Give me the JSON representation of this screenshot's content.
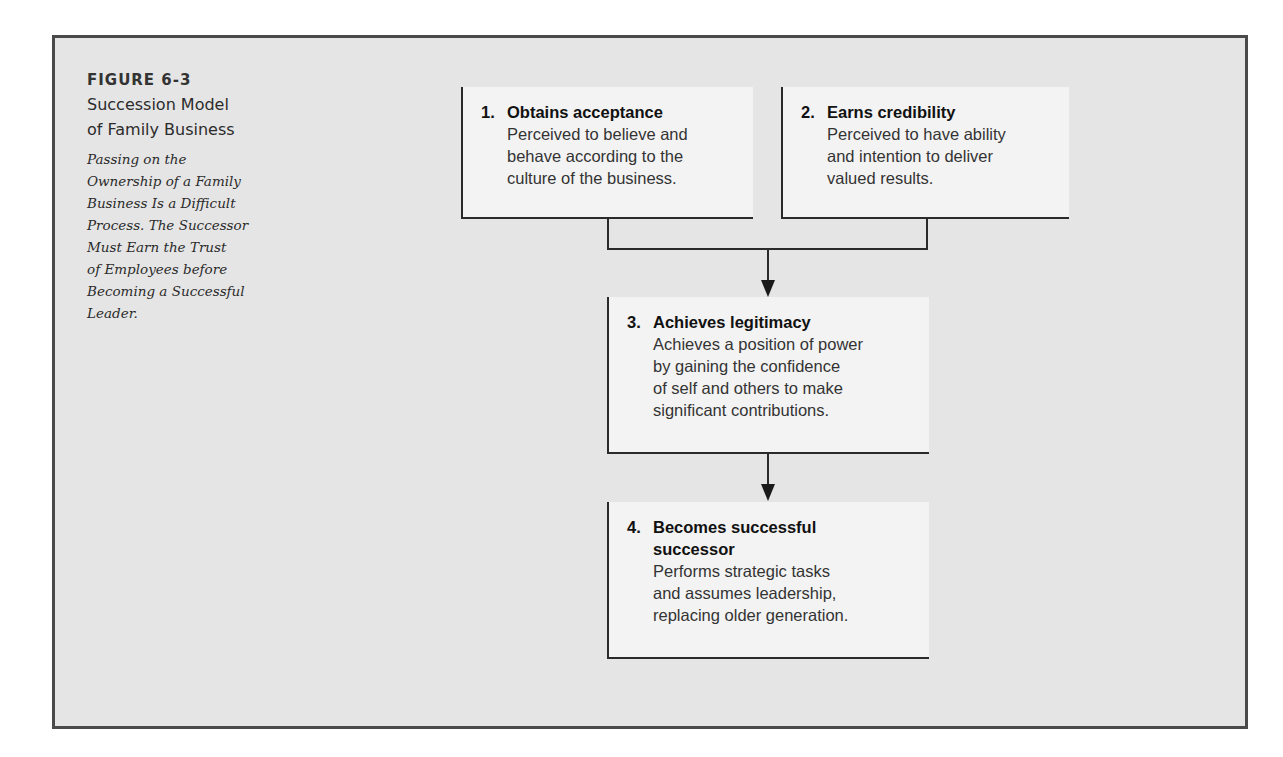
{
  "figure": {
    "label": "FIGURE 6-3",
    "title_line1": "Succession Model",
    "title_line2": "of Family Business",
    "description_lines": [
      "Passing on the",
      "Ownership of a Family",
      "Business Is a Difficult",
      "Process. The Successor",
      "Must Earn the Trust",
      "of Employees before",
      "Becoming a Successful",
      "Leader."
    ]
  },
  "steps": [
    {
      "number": "1.",
      "title_lines": [
        "Obtains acceptance"
      ],
      "body_lines": [
        "Perceived to believe and",
        "behave according to the",
        "culture of the business."
      ]
    },
    {
      "number": "2.",
      "title_lines": [
        "Earns credibility"
      ],
      "body_lines": [
        "Perceived to have ability",
        "and intention to deliver",
        "valued results."
      ]
    },
    {
      "number": "3.",
      "title_lines": [
        "Achieves legitimacy"
      ],
      "body_lines": [
        "Achieves a position of power",
        "by gaining the confidence",
        "of self and others to make",
        "significant contributions."
      ]
    },
    {
      "number": "4.",
      "title_lines": [
        "Becomes successful",
        "successor"
      ],
      "body_lines": [
        "Performs strategic tasks",
        "and assumes leadership,",
        "replacing older generation."
      ]
    }
  ],
  "colors": {
    "frame_background": "#e5e5e5",
    "box_background": "#f3f3f3",
    "line": "#2a2a2a"
  }
}
